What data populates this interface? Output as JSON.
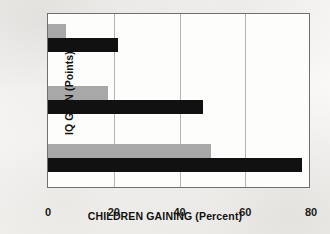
{
  "chart_data": {
    "type": "bar",
    "orientation": "horizontal",
    "title": "",
    "xlabel": "CHILDREN GAINING (Percent)",
    "ylabel": "IQ GAIN (Points)",
    "categories": [
      "10",
      "20",
      "30"
    ],
    "xlim": [
      0,
      80
    ],
    "xticks": [
      0,
      20,
      40,
      60,
      80
    ],
    "xtick_labels": [
      "0",
      "20",
      "40",
      "60",
      "80"
    ],
    "ytick_labels": [
      "30",
      "20",
      "10"
    ],
    "grid": "vertical",
    "legend": "none",
    "series": [
      {
        "name": "light-gray-series",
        "color": "#a8a8a8",
        "values": [
          50,
          18.5,
          5.5
        ]
      },
      {
        "name": "dark-series",
        "color": "#111111",
        "values": [
          78,
          47.5,
          21.5
        ]
      }
    ],
    "bars": [
      {
        "group": "30",
        "series": "light-gray-series",
        "value": 5.5,
        "color": "#a8a8a8"
      },
      {
        "group": "30",
        "series": "dark-series",
        "value": 21.5,
        "color": "#111111"
      },
      {
        "group": "20",
        "series": "light-gray-series",
        "value": 18.5,
        "color": "#a8a8a8"
      },
      {
        "group": "20",
        "series": "dark-series",
        "value": 47.5,
        "color": "#111111"
      },
      {
        "group": "10",
        "series": "light-gray-series",
        "value": 50,
        "color": "#a8a8a8"
      },
      {
        "group": "10",
        "series": "dark-series",
        "value": 78,
        "color": "#111111"
      }
    ]
  },
  "axes": {
    "y_title": "IQ GAIN (Points)",
    "x_title": "CHILDREN GAINING (Percent)",
    "y_labels": [
      "30",
      "20",
      "10"
    ],
    "x_labels": [
      "0",
      "20",
      "40",
      "60",
      "80"
    ]
  },
  "colors": {
    "light_bar": "#a8a8a8",
    "dark_bar": "#111111",
    "frame": "#6f6f6f",
    "gridline": "#b4b4b4",
    "page_background": "#f7f6f4",
    "plot_background": "#fdfdfc"
  }
}
